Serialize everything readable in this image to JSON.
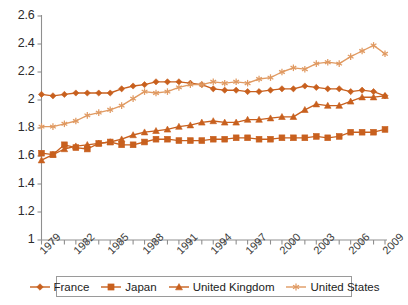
{
  "chart_data": {
    "type": "line",
    "title": "",
    "subtitle": "",
    "xlabel": "",
    "ylabel": "",
    "grid": false,
    "legend_position": "bottom",
    "accent_color": "#C8601E",
    "xlim": [
      1979,
      2009
    ],
    "ylim": [
      1,
      2.6
    ],
    "ytick_labels": [
      "2.6",
      "2.4",
      "2.2",
      "2",
      "1.8",
      "1.6",
      "1.4",
      "1.2",
      "1"
    ],
    "ytick_values": [
      2.6,
      2.4,
      2.2,
      2.0,
      1.8,
      1.6,
      1.4,
      1.2,
      1.0
    ],
    "xtick_labels": [
      "1979",
      "1982",
      "1985",
      "1988",
      "1991",
      "1994",
      "1997",
      "2000",
      "2003",
      "2006",
      "2009"
    ],
    "xtick_values": [
      1979,
      1982,
      1985,
      1988,
      1991,
      1994,
      1997,
      2000,
      2003,
      2006,
      2009
    ],
    "x": [
      1979,
      1980,
      1981,
      1982,
      1983,
      1984,
      1985,
      1986,
      1987,
      1988,
      1989,
      1990,
      1991,
      1992,
      1993,
      1994,
      1995,
      1996,
      1997,
      1998,
      1999,
      2000,
      2001,
      2002,
      2003,
      2004,
      2005,
      2006,
      2007,
      2008,
      2009
    ],
    "series": [
      {
        "name": "France",
        "marker": "diamond",
        "color": "#C8601E",
        "values": [
          2.04,
          2.03,
          2.04,
          2.05,
          2.05,
          2.05,
          2.05,
          2.08,
          2.1,
          2.11,
          2.13,
          2.13,
          2.13,
          2.12,
          2.11,
          2.08,
          2.07,
          2.07,
          2.06,
          2.06,
          2.07,
          2.08,
          2.08,
          2.1,
          2.09,
          2.08,
          2.08,
          2.06,
          2.07,
          2.06,
          2.03
        ]
      },
      {
        "name": "Japan",
        "marker": "square",
        "color": "#C8601E",
        "values": [
          1.62,
          1.61,
          1.68,
          1.66,
          1.65,
          1.69,
          1.7,
          1.68,
          1.68,
          1.7,
          1.72,
          1.72,
          1.71,
          1.71,
          1.71,
          1.72,
          1.72,
          1.73,
          1.73,
          1.72,
          1.72,
          1.73,
          1.73,
          1.73,
          1.74,
          1.73,
          1.74,
          1.77,
          1.77,
          1.77,
          1.79
        ]
      },
      {
        "name": "United Kingdom",
        "marker": "triangle",
        "color": "#C8601E",
        "values": [
          1.57,
          1.61,
          1.65,
          1.67,
          1.68,
          1.69,
          1.7,
          1.72,
          1.75,
          1.77,
          1.78,
          1.79,
          1.81,
          1.82,
          1.84,
          1.85,
          1.84,
          1.84,
          1.86,
          1.86,
          1.87,
          1.88,
          1.88,
          1.93,
          1.97,
          1.96,
          1.96,
          1.99,
          2.02,
          2.02,
          2.03
        ]
      },
      {
        "name": "United States",
        "marker": "star",
        "color": "#E09A62",
        "values": [
          1.81,
          1.81,
          1.83,
          1.85,
          1.89,
          1.91,
          1.93,
          1.96,
          2.01,
          2.06,
          2.05,
          2.06,
          2.09,
          2.11,
          2.11,
          2.13,
          2.12,
          2.13,
          2.12,
          2.15,
          2.16,
          2.2,
          2.23,
          2.22,
          2.26,
          2.27,
          2.26,
          2.31,
          2.35,
          2.39,
          2.33
        ]
      }
    ]
  },
  "legend": {
    "items": [
      {
        "label": "France",
        "marker": "diamond"
      },
      {
        "label": "Japan",
        "marker": "square"
      },
      {
        "label": "United Kingdom",
        "marker": "triangle"
      },
      {
        "label": "United States",
        "marker": "star"
      }
    ]
  }
}
